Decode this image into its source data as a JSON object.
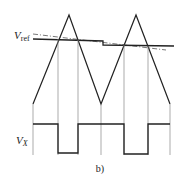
{
  "figure": {
    "caption": "b)",
    "labels": {
      "vref_main": "V",
      "vref_sub": "ref",
      "vx_main": "V",
      "vx_sub": "X"
    },
    "colors": {
      "line": "#222222",
      "guide": "#777777",
      "background": "#ffffff"
    }
  }
}
